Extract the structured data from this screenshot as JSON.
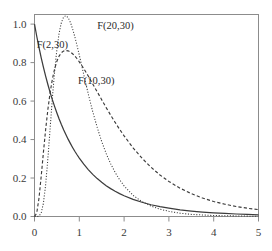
{
  "chart_data": {
    "type": "line",
    "title": "",
    "xlabel": "",
    "ylabel": "",
    "xlim": [
      0,
      5
    ],
    "ylim": [
      0,
      1.05
    ],
    "grid": false,
    "legend_position": "inline-annotations",
    "xticks": [
      "0",
      "1",
      "2",
      "3",
      "4",
      "5"
    ],
    "xtick_values": [
      0,
      1,
      2,
      3,
      4,
      5
    ],
    "yticks": [
      "0.0",
      "0.2",
      "0.4",
      "0.6",
      "0.8",
      "1.0"
    ],
    "ytick_values": [
      0.0,
      0.2,
      0.4,
      0.6,
      0.8,
      1.0
    ],
    "x": [
      0.0,
      0.05,
      0.1,
      0.15,
      0.2,
      0.25,
      0.3,
      0.35,
      0.4,
      0.45,
      0.5,
      0.55,
      0.6,
      0.65,
      0.7,
      0.75,
      0.8,
      0.85,
      0.9,
      0.95,
      1.0,
      1.1,
      1.2,
      1.3,
      1.4,
      1.5,
      1.6,
      1.7,
      1.8,
      1.9,
      2.0,
      2.2,
      2.4,
      2.6,
      2.8,
      3.0,
      3.25,
      3.5,
      3.75,
      4.0,
      4.25,
      4.5,
      4.75,
      5.0
    ],
    "series": [
      {
        "name": "F(2,30)",
        "label": "F(2,30)",
        "style": "solid",
        "df1": 2,
        "df2": 30,
        "values": [
          1.0,
          0.937,
          0.879,
          0.825,
          0.775,
          0.728,
          0.685,
          0.644,
          0.606,
          0.571,
          0.538,
          0.507,
          0.478,
          0.451,
          0.426,
          0.402,
          0.38,
          0.359,
          0.339,
          0.321,
          0.304,
          0.272,
          0.244,
          0.219,
          0.197,
          0.178,
          0.16,
          0.145,
          0.131,
          0.119,
          0.108,
          0.089,
          0.074,
          0.061,
          0.051,
          0.043,
          0.034,
          0.028,
          0.023,
          0.019,
          0.016,
          0.013,
          0.011,
          0.009
        ]
      },
      {
        "name": "F(10,30)",
        "label": "F(10,30)",
        "style": "dashed",
        "df1": 10,
        "df2": 30,
        "values": [
          0.0,
          0.018,
          0.095,
          0.21,
          0.336,
          0.455,
          0.559,
          0.646,
          0.715,
          0.768,
          0.807,
          0.834,
          0.851,
          0.86,
          0.863,
          0.861,
          0.855,
          0.846,
          0.834,
          0.82,
          0.804,
          0.769,
          0.73,
          0.689,
          0.648,
          0.607,
          0.566,
          0.527,
          0.489,
          0.453,
          0.419,
          0.357,
          0.303,
          0.256,
          0.216,
          0.182,
          0.147,
          0.119,
          0.096,
          0.078,
          0.064,
          0.052,
          0.043,
          0.036
        ]
      },
      {
        "name": "F(20,30)",
        "label": "F(20,30)",
        "style": "dotted",
        "df1": 20,
        "df2": 30,
        "values": [
          0.0,
          0.0,
          0.002,
          0.018,
          0.07,
          0.168,
          0.305,
          0.462,
          0.618,
          0.756,
          0.869,
          0.953,
          1.008,
          1.037,
          1.044,
          1.034,
          1.01,
          0.976,
          0.934,
          0.888,
          0.839,
          0.737,
          0.637,
          0.545,
          0.463,
          0.39,
          0.327,
          0.274,
          0.229,
          0.191,
          0.159,
          0.11,
          0.077,
          0.054,
          0.038,
          0.027,
          0.017,
          0.011,
          0.008,
          0.005,
          0.004,
          0.003,
          0.002,
          0.001
        ]
      }
    ],
    "annotations": [
      {
        "text": "F(2,30)",
        "x": 0.05,
        "y": 0.875
      },
      {
        "text": "F(10,30)",
        "x": 0.97,
        "y": 0.69
      },
      {
        "text": "F(20,30)",
        "x": 1.4,
        "y": 0.975
      }
    ],
    "colors": {
      "background": "#ffffff",
      "frame": "#8c8c8c",
      "curve": "#3c3c3c",
      "text": "#2b2b2b"
    }
  }
}
